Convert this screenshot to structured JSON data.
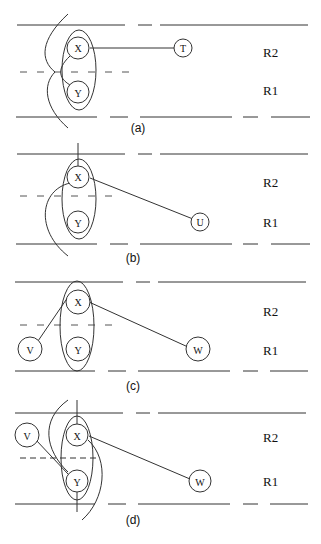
{
  "figure": {
    "panels": [
      {
        "caption": "(a)",
        "region_labels": {
          "upper": "R2",
          "lower": "R1"
        },
        "nodes": [
          {
            "id": "X",
            "label": "X"
          },
          {
            "id": "Y",
            "label": "Y"
          },
          {
            "id": "T",
            "label": "T"
          }
        ],
        "edges": [
          [
            "X",
            "T"
          ],
          [
            "X",
            "Y"
          ]
        ]
      },
      {
        "caption": "(b)",
        "region_labels": {
          "upper": "R2",
          "lower": "R1"
        },
        "nodes": [
          {
            "id": "X",
            "label": "X"
          },
          {
            "id": "Y",
            "label": "Y"
          },
          {
            "id": "U",
            "label": "U"
          }
        ],
        "edges": [
          [
            "X",
            "U"
          ]
        ]
      },
      {
        "caption": "(c)",
        "region_labels": {
          "upper": "R2",
          "lower": "R1"
        },
        "nodes": [
          {
            "id": "V",
            "label": "V"
          },
          {
            "id": "X",
            "label": "X"
          },
          {
            "id": "Y",
            "label": "Y"
          },
          {
            "id": "W",
            "label": "W"
          }
        ],
        "edges": [
          [
            "V",
            "X"
          ],
          [
            "X",
            "W"
          ]
        ]
      },
      {
        "caption": "(d)",
        "region_labels": {
          "upper": "R2",
          "lower": "R1"
        },
        "nodes": [
          {
            "id": "V",
            "label": "V"
          },
          {
            "id": "X",
            "label": "X"
          },
          {
            "id": "Y",
            "label": "Y"
          },
          {
            "id": "W",
            "label": "W"
          }
        ],
        "edges": [
          [
            "V",
            "Y"
          ],
          [
            "X",
            "W"
          ]
        ]
      }
    ]
  }
}
